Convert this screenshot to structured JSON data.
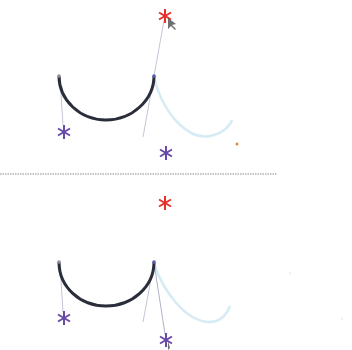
{
  "diagram": {
    "colors": {
      "curve": "#2a2d3a",
      "ghost_curve": "#d8ecf4",
      "handle_line": "#b8bccf",
      "control_point": "#6a4aa8",
      "anchor_handle": "#e8302a",
      "stray_dot": "#d98a3a",
      "divider": "#7a7a7a"
    },
    "divider": {
      "y": 174,
      "x1": 0,
      "x2": 277,
      "style": "dotted"
    },
    "panels": [
      {
        "name": "top",
        "curve": {
          "start": [
            59,
            76
          ],
          "end": [
            154,
            76
          ],
          "bottom_y": 120
        },
        "ghost_curve": {
          "start": [
            154,
            76
          ],
          "end": [
            232,
            120
          ]
        },
        "red_star": [
          165,
          15
        ],
        "purple_stars": [
          [
            64,
            132
          ],
          [
            166,
            153
          ]
        ],
        "cursor_on": "red_star",
        "stray_dot": [
          237,
          144
        ]
      },
      {
        "name": "bottom",
        "curve": {
          "start": [
            59,
            262
          ],
          "end": [
            154,
            262
          ],
          "bottom_y": 306
        },
        "ghost_curve": {
          "start": [
            154,
            262
          ],
          "end": [
            230,
            306
          ]
        },
        "red_star": [
          165,
          203
        ],
        "purple_stars": [
          [
            64,
            318
          ],
          [
            166,
            339
          ]
        ],
        "cursor_on": "purple_star_right"
      }
    ]
  }
}
